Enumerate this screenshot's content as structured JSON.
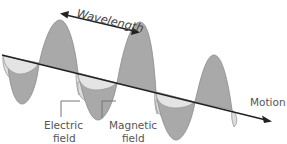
{
  "diagram": {
    "labels": {
      "wavelength": "Wavelength",
      "motion": "Motion",
      "electric_line1": "Electric",
      "electric_line2": "field",
      "magnetic_line1": "Magnetic",
      "magnetic_line2": "field"
    },
    "colors": {
      "electric_fill": "#a9a9a9",
      "magnetic_fill": "#dcdcdc",
      "outline": "#8a8a8a",
      "axis": "#222222",
      "text": "#555555"
    },
    "components": [
      {
        "name": "electric field",
        "orientation": "vertical",
        "shade": "dark gray"
      },
      {
        "name": "magnetic field",
        "orientation": "horizontal",
        "shade": "light gray"
      }
    ]
  }
}
